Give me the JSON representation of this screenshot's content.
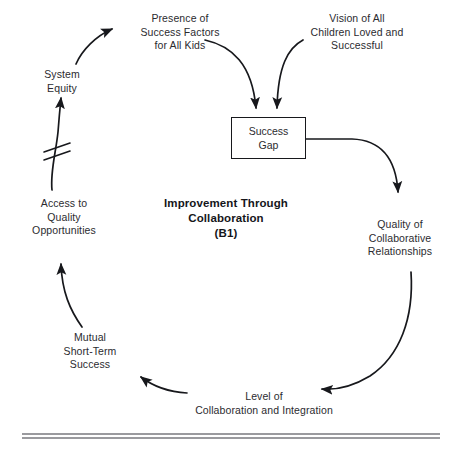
{
  "diagram": {
    "title": "Improvement Through Collaboration\n(B1)",
    "loop_label": "(B1)",
    "type": "causal-loop-diagram",
    "stroke_color": "#17181c",
    "text_color": "#2b2b2f",
    "background_color": "#ffffff",
    "rule_color": "#9a9a9e",
    "nodes": [
      {
        "id": "presence-of-success-factors",
        "label": "Presence of\nSuccess Factors\nfor All Kids",
        "shape": "text",
        "x": 134,
        "y": 12,
        "width": 92
      },
      {
        "id": "vision-of-all-children",
        "label": "Vision of All\nChildren Loved and\nSuccessful",
        "shape": "text",
        "x": 297,
        "y": 12,
        "width": 120
      },
      {
        "id": "system-equity",
        "label": "System\nEquity",
        "shape": "text",
        "x": 30,
        "y": 68,
        "width": 64
      },
      {
        "id": "success-gap",
        "label": "Success\nGap",
        "shape": "rectangle",
        "x": 231,
        "y": 117,
        "width": 75,
        "height": 42
      },
      {
        "id": "access-to-quality-opportunities",
        "label": "Access to\nQuality\nOpportunities",
        "shape": "text",
        "x": 14,
        "y": 197,
        "width": 100
      },
      {
        "id": "quality-of-collaborative-relationships",
        "label": "Quality of\nCollaborative\nRelationships",
        "shape": "text",
        "x": 350,
        "y": 218,
        "width": 100
      },
      {
        "id": "mutual-short-term-success",
        "label": "Mutual\nShort-Term\nSuccess",
        "shape": "text",
        "x": 48,
        "y": 331,
        "width": 84
      },
      {
        "id": "level-of-collaboration-and-integration",
        "label": "Level of\nCollaboration and Integration",
        "shape": "text",
        "x": 189,
        "y": 390,
        "width": 150
      }
    ],
    "links": [
      {
        "id": "presence-to-success-gap",
        "from": "presence-of-success-factors",
        "to": "success-gap",
        "style": "curved-arrow"
      },
      {
        "id": "vision-to-success-gap",
        "from": "vision-of-all-children",
        "to": "success-gap",
        "style": "curved-arrow"
      },
      {
        "id": "success-gap-to-quality-of-collaborative-relationships",
        "from": "success-gap",
        "to": "quality-of-collaborative-relationships",
        "style": "curved-arrow"
      },
      {
        "id": "quality-to-level-of-collaboration",
        "from": "quality-of-collaborative-relationships",
        "to": "level-of-collaboration-and-integration",
        "style": "curved-arrow"
      },
      {
        "id": "level-to-mutual-short-term-success",
        "from": "level-of-collaboration-and-integration",
        "to": "mutual-short-term-success",
        "style": "curved-arrow"
      },
      {
        "id": "mutual-to-access-to-quality",
        "from": "mutual-short-term-success",
        "to": "access-to-quality-opportunities",
        "style": "curved-arrow"
      },
      {
        "id": "access-to-system-equity",
        "from": "access-to-quality-opportunities",
        "to": "system-equity",
        "style": "curved-arrow-with-delay"
      },
      {
        "id": "system-equity-to-presence",
        "from": "system-equity",
        "to": "presence-of-success-factors",
        "style": "curved-arrow"
      }
    ],
    "delay_marker": {
      "id": "delay-marker",
      "label": "delay",
      "notation": "double-slash"
    },
    "footer_rule": {
      "id": "footer-rule",
      "style": "double-line"
    }
  }
}
